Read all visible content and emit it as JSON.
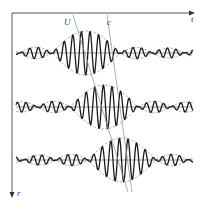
{
  "figure": {
    "axes": {
      "origin": [
        12,
        13
      ],
      "t_axis": {
        "label": "t",
        "end": [
          195,
          13
        ],
        "label_pos": [
          191,
          22
        ]
      },
      "r_axis": {
        "label": "r",
        "end": [
          12,
          198
        ],
        "label_pos": [
          17,
          196
        ]
      }
    },
    "velocity_lines": [
      {
        "label": "U",
        "meaning": "group velocity",
        "from": [
          73,
          15
        ],
        "to": [
          128,
          192
        ],
        "label_pos": [
          64,
          25
        ]
      },
      {
        "label": "c",
        "meaning": "phase velocity",
        "from": [
          107,
          15
        ],
        "to": [
          132,
          192
        ],
        "label_pos": [
          107,
          25
        ]
      }
    ],
    "wave_packets": [
      {
        "row": 1,
        "baseline_y": 53,
        "envelope_center_x": 86,
        "amplitude": 22,
        "phase_x": 90
      },
      {
        "row": 2,
        "baseline_y": 107,
        "envelope_center_x": 104,
        "amplitude": 22,
        "phase_x": 112
      },
      {
        "row": 3,
        "baseline_y": 160,
        "envelope_center_x": 122,
        "amplitude": 22,
        "phase_x": 128
      }
    ],
    "wave_params": {
      "x_start": 16,
      "x_end": 193,
      "carrier_period": 8.6,
      "main_lobe_halfwidth": 34,
      "side_lobe_ratio": 0.26
    },
    "colors": {
      "carrier": "#1a1a1a",
      "envelope": "#888888",
      "axes": "#555555",
      "velocity_lines": "#999999"
    }
  }
}
